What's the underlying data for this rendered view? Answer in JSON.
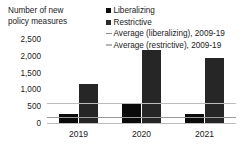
{
  "chart": {
    "axis_title": "Number of new\npolicy measures"
  },
  "legend": {
    "position": "top-right",
    "items": [
      {
        "label": "Liberalizing",
        "marker": "filled-square-icon",
        "color": "#0d0d0d"
      },
      {
        "label": "Restrictive",
        "marker": "filled-square-icon",
        "color": "#2b2b2b"
      },
      {
        "label": "Average (liberalizing), 2009-19",
        "marker": "horizontal-line-icon",
        "color": "#8f8f8f"
      },
      {
        "label": "Average (restrictive), 2009-19",
        "marker": "horizontal-line-icon",
        "color": "#b5b5b5"
      }
    ]
  },
  "chart_data": {
    "type": "bar",
    "title": "",
    "subtitle": "",
    "xlabel": "",
    "ylabel": "Number of new policy measures",
    "categories": [
      "2019",
      "2020",
      "2021"
    ],
    "series": [
      {
        "name": "Liberalizing",
        "color": "#0a0a0a",
        "values": [
          300,
          620,
          300
        ]
      },
      {
        "name": "Restrictive",
        "color": "#262626",
        "values": [
          1200,
          2200,
          1950
        ]
      }
    ],
    "reference_lines": [
      {
        "name": "Average (restrictive), 2009-19",
        "value": 630,
        "color": "#bcbcbc"
      },
      {
        "name": "Average (liberalizing), 2009-19",
        "value": 210,
        "color": "#9a9a9a"
      }
    ],
    "ylim": [
      0,
      2500
    ],
    "ytick_values": [
      0,
      500,
      1000,
      1500,
      2000,
      2500
    ],
    "ytick_labels": [
      "0",
      "500",
      "1,000",
      "1,500",
      "2,000",
      "2,500"
    ],
    "grid": false,
    "legend_position": "top-right"
  }
}
